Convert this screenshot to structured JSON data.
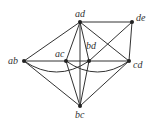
{
  "diagram": {
    "type": "graph",
    "nodes": [
      {
        "id": "ad",
        "label": "ad",
        "x": 80,
        "y": 22,
        "lx": 75,
        "ly": 9
      },
      {
        "id": "de",
        "label": "de",
        "x": 132,
        "y": 22,
        "lx": 136,
        "ly": 13
      },
      {
        "id": "ab",
        "label": "ab",
        "x": 24,
        "y": 61,
        "lx": 8,
        "ly": 56
      },
      {
        "id": "ac",
        "label": "ac",
        "x": 66,
        "y": 61,
        "lx": 55,
        "ly": 49
      },
      {
        "id": "bd",
        "label": "bd",
        "x": 89,
        "y": 61,
        "lx": 86,
        "ly": 41
      },
      {
        "id": "cd",
        "label": "cd",
        "x": 129,
        "y": 61,
        "lx": 133,
        "ly": 60
      },
      {
        "id": "bc",
        "label": "bc",
        "x": 80,
        "y": 106,
        "lx": 75,
        "ly": 110
      }
    ],
    "edges": [
      {
        "from": "ad",
        "to": "de"
      },
      {
        "from": "ad",
        "to": "ab"
      },
      {
        "from": "ad",
        "to": "ac"
      },
      {
        "from": "ad",
        "to": "bd"
      },
      {
        "from": "ad",
        "to": "cd"
      },
      {
        "from": "ad",
        "to": "bc"
      },
      {
        "from": "de",
        "to": "cd"
      },
      {
        "from": "de",
        "to": "bd"
      },
      {
        "from": "ab",
        "to": "cd"
      },
      {
        "from": "ab",
        "to": "bc"
      },
      {
        "from": "ac",
        "to": "bc"
      },
      {
        "from": "bd",
        "to": "bc"
      },
      {
        "from": "cd",
        "to": "bc"
      },
      {
        "from": "ab",
        "to": "bd",
        "curved": true
      },
      {
        "from": "ac",
        "to": "cd",
        "curved": true
      }
    ],
    "colors": {
      "line": "#333333",
      "node": "#222222"
    }
  }
}
